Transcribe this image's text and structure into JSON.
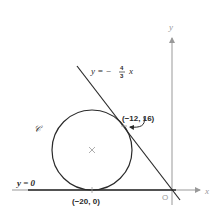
{
  "diagram": {
    "origin_label": "O",
    "x_axis_label": "x",
    "y_axis_label": "y",
    "line_label_prefix": "y = −",
    "line_label_num": "4",
    "line_label_den": "3",
    "line_label_suffix": "x",
    "baseline_label": "y = 0",
    "circle_label": "𝒞",
    "tangent_point_label": "(−12, 16)",
    "bottom_point_label": "(−20, 0)",
    "center_marker": "×",
    "colors": {
      "ink": "#2a2a2a",
      "axis": "#999999"
    }
  }
}
